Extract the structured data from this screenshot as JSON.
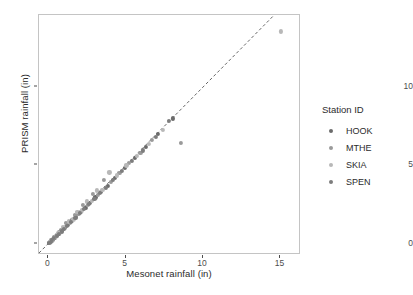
{
  "chart_data": {
    "type": "scatter",
    "title": "",
    "xlabel": "Mesonet rainfall (in)",
    "ylabel": "PRISM rainfall (in)",
    "xlim": [
      -0.6,
      16.2
    ],
    "ylim": [
      -0.6,
      14.6
    ],
    "xticks": [
      0,
      5,
      10,
      15
    ],
    "yticks": [
      0,
      5,
      10
    ],
    "xtick_labels": [
      "0",
      "5",
      "10",
      "15"
    ],
    "ytick_labels": [
      "0",
      "5",
      "10"
    ],
    "grid": false,
    "legend_title": "Station ID",
    "legend_position": "right",
    "reference_line": {
      "type": "abline",
      "slope": 1,
      "intercept": 0,
      "style": "dashed",
      "color": "#555555"
    },
    "series": [
      {
        "name": "HOOK",
        "color": "#6b6b6b",
        "points": [
          [
            0.05,
            0.04
          ],
          [
            0.12,
            0.1
          ],
          [
            0.22,
            0.18
          ],
          [
            0.3,
            0.26
          ],
          [
            0.45,
            0.4
          ],
          [
            0.58,
            0.55
          ],
          [
            0.7,
            0.62
          ],
          [
            0.85,
            0.8
          ],
          [
            1.05,
            1.0
          ],
          [
            1.28,
            1.2
          ],
          [
            1.55,
            1.48
          ],
          [
            1.8,
            1.72
          ],
          [
            2.1,
            2.05
          ],
          [
            2.4,
            2.3
          ],
          [
            2.7,
            2.62
          ],
          [
            3.05,
            2.95
          ],
          [
            3.4,
            3.3
          ],
          [
            3.85,
            3.7
          ],
          [
            4.3,
            4.2
          ],
          [
            4.95,
            4.85
          ],
          [
            5.6,
            5.45
          ],
          [
            6.3,
            6.2
          ],
          [
            7.1,
            7.0
          ],
          [
            8.05,
            8.0
          ]
        ]
      },
      {
        "name": "MTHE",
        "color": "#9a9a9a",
        "points": [
          [
            0.08,
            0.07
          ],
          [
            0.18,
            0.2
          ],
          [
            0.28,
            0.32
          ],
          [
            0.4,
            0.44
          ],
          [
            0.52,
            0.5
          ],
          [
            0.66,
            0.72
          ],
          [
            0.8,
            0.88
          ],
          [
            0.98,
            0.92
          ],
          [
            1.15,
            1.3
          ],
          [
            1.42,
            1.35
          ],
          [
            1.7,
            1.85
          ],
          [
            1.95,
            1.9
          ],
          [
            2.25,
            2.45
          ],
          [
            2.55,
            2.5
          ],
          [
            2.9,
            3.15
          ],
          [
            3.2,
            3.1
          ],
          [
            3.6,
            4.05
          ],
          [
            4.05,
            3.95
          ],
          [
            4.6,
            4.5
          ],
          [
            5.2,
            5.15
          ],
          [
            5.95,
            5.8
          ],
          [
            6.7,
            6.6
          ],
          [
            8.55,
            6.45
          ]
        ]
      },
      {
        "name": "SKIA",
        "color": "#b8b8b8",
        "points": [
          [
            0.1,
            0.12
          ],
          [
            0.2,
            0.15
          ],
          [
            0.34,
            0.38
          ],
          [
            0.48,
            0.42
          ],
          [
            0.62,
            0.68
          ],
          [
            0.75,
            0.7
          ],
          [
            0.92,
            1.05
          ],
          [
            1.1,
            1.08
          ],
          [
            1.35,
            1.42
          ],
          [
            1.62,
            1.55
          ],
          [
            1.88,
            2.0
          ],
          [
            2.18,
            2.12
          ],
          [
            2.48,
            2.7
          ],
          [
            2.8,
            2.75
          ],
          [
            3.12,
            3.4
          ],
          [
            3.5,
            3.45
          ],
          [
            3.95,
            4.55
          ],
          [
            4.45,
            4.35
          ],
          [
            5.05,
            5.0
          ],
          [
            5.75,
            5.6
          ],
          [
            6.5,
            6.35
          ],
          [
            7.4,
            7.25
          ],
          [
            15.05,
            13.55
          ]
        ]
      },
      {
        "name": "SPEN",
        "color": "#7d7d7d",
        "points": [
          [
            0.06,
            0.05
          ],
          [
            0.15,
            0.13
          ],
          [
            0.26,
            0.24
          ],
          [
            0.38,
            0.35
          ],
          [
            0.55,
            0.48
          ],
          [
            0.68,
            0.6
          ],
          [
            0.88,
            0.78
          ],
          [
            1.02,
            0.95
          ],
          [
            1.22,
            1.15
          ],
          [
            1.48,
            1.4
          ],
          [
            1.75,
            1.65
          ],
          [
            2.02,
            1.95
          ],
          [
            2.32,
            2.22
          ],
          [
            2.62,
            2.55
          ],
          [
            2.98,
            2.85
          ],
          [
            3.32,
            3.22
          ],
          [
            3.72,
            3.58
          ],
          [
            4.18,
            4.08
          ],
          [
            4.75,
            4.62
          ],
          [
            5.4,
            5.3
          ],
          [
            6.1,
            5.95
          ],
          [
            6.95,
            6.8
          ],
          [
            7.8,
            7.85
          ]
        ]
      }
    ]
  }
}
